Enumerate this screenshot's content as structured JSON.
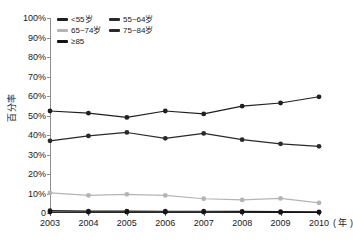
{
  "chart_data": {
    "type": "line",
    "title": "",
    "xlabel": "年",
    "ylabel": "百分率",
    "x": [
      "2003",
      "2004",
      "2005",
      "2006",
      "2007",
      "2008",
      "2009",
      "2010"
    ],
    "categories": [
      "2003",
      "2004",
      "2005",
      "2006",
      "2007",
      "2008",
      "2009",
      "2010"
    ],
    "ylim": [
      0,
      100
    ],
    "xlim": [
      "2003",
      "2010"
    ],
    "grid": false,
    "legend_position": "top-left-inside",
    "y_tick_labels": [
      "100%",
      "90%",
      "80%",
      "70%",
      "60%",
      "50%",
      "40%",
      "30%",
      "20%",
      "10%",
      "0"
    ],
    "y_tick_values": [
      100,
      90,
      80,
      70,
      60,
      50,
      40,
      30,
      20,
      10,
      0
    ],
    "x_tick_labels": [
      "2003",
      "2004",
      "2005",
      "2006",
      "2007",
      "2008",
      "2009",
      "2010"
    ],
    "x_unit_label": "( 年 )",
    "series": [
      {
        "name": "<55岁",
        "color": "#1f1f1f",
        "values": [
          1.2,
          1.0,
          1.0,
          0.9,
          0.9,
          0.8,
          0.7,
          0.6
        ]
      },
      {
        "name": "55~64岁",
        "color": "#2a2a2a",
        "values": [
          37.0,
          39.5,
          41.3,
          38.3,
          40.8,
          37.6,
          35.5,
          34.2
        ]
      },
      {
        "name": "65~74岁",
        "color": "#b4b4b4",
        "values": [
          10.3,
          9.0,
          9.6,
          9.0,
          7.3,
          6.7,
          7.5,
          5.2
        ]
      },
      {
        "name": "75~84岁",
        "color": "#1f1f1f",
        "values": [
          52.3,
          51.2,
          49.0,
          52.3,
          50.8,
          54.8,
          56.4,
          59.6
        ]
      },
      {
        "name": "≥85",
        "color": "#151515",
        "values": [
          0.5,
          0.4,
          0.4,
          0.4,
          0.4,
          0.4,
          0.3,
          0.3
        ]
      }
    ]
  },
  "legend": {
    "entries": [
      {
        "label": "<55岁",
        "color": "#1f1f1f"
      },
      {
        "label": "55~64岁",
        "color": "#2a2a2a"
      },
      {
        "label": "65~74岁",
        "color": "#b4b4b4"
      },
      {
        "label": "75~84岁",
        "color": "#2a2a2a"
      },
      {
        "label": "≥85",
        "color": "#151515"
      }
    ]
  }
}
